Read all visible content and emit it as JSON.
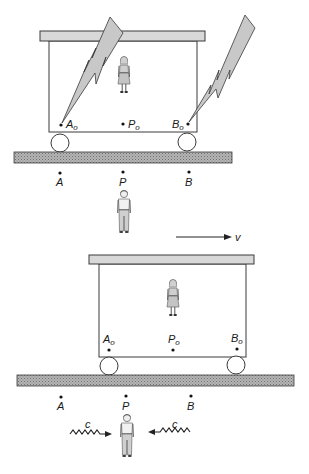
{
  "figure": {
    "colors": {
      "line": "#3a3a3a",
      "roof_fill": "#d8d8d8",
      "bolt_fill": "#c8c8c8",
      "ground_fill": "#a8a8a8",
      "background": "#ffffff"
    },
    "top_panel": {
      "car_points": {
        "a0": {
          "base": "A",
          "subscript": "o"
        },
        "p0": {
          "base": "P",
          "subscript": "o"
        },
        "b0": {
          "base": "B",
          "subscript": "o"
        }
      },
      "ground_points": {
        "a": "A",
        "p": "P",
        "b": "B"
      },
      "lightning_bolts": [
        "left-bolt-at-A0",
        "right-bolt-at-B0"
      ],
      "observer_in_car": "woman",
      "observer_on_ground": "man"
    },
    "velocity": {
      "label": "v"
    },
    "bottom_panel": {
      "car_points": {
        "a0": {
          "base": "A",
          "subscript": "o"
        },
        "p0": {
          "base": "P",
          "subscript": "o"
        },
        "b0": {
          "base": "B",
          "subscript": "o"
        }
      },
      "ground_points": {
        "a": "A",
        "p": "P",
        "b": "B"
      },
      "light_signals": {
        "left": "c",
        "right": "c"
      },
      "observer_in_car": "woman",
      "observer_on_ground": "man"
    }
  }
}
